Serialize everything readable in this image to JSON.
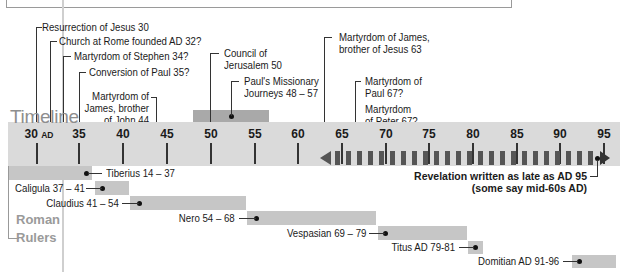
{
  "title": "Timeline",
  "scale": {
    "start_year": 30,
    "end_year": 95,
    "start_x": 37,
    "px_per_year": 8.72
  },
  "ticks": [
    {
      "year": 30,
      "label": "30",
      "suffix": "AD",
      "x": 37
    },
    {
      "year": 35,
      "label": "35",
      "x": 79
    },
    {
      "year": 40,
      "label": "40",
      "x": 123
    },
    {
      "year": 45,
      "label": "45",
      "x": 167
    },
    {
      "year": 50,
      "label": "50",
      "x": 211
    },
    {
      "year": 55,
      "label": "55",
      "x": 255
    },
    {
      "year": 60,
      "label": "60",
      "x": 298
    },
    {
      "year": 65,
      "label": "65",
      "x": 342
    },
    {
      "year": 70,
      "label": "70",
      "x": 386
    },
    {
      "year": 75,
      "label": "75",
      "x": 429
    },
    {
      "year": 80,
      "label": "80",
      "x": 473
    },
    {
      "year": 85,
      "label": "85",
      "x": 517
    },
    {
      "year": 90,
      "label": "90",
      "x": 560
    },
    {
      "year": 95,
      "label": "95",
      "x": 604
    }
  ],
  "events": [
    {
      "id": "resurrection",
      "label": "Resurrection of Jesus 30"
    },
    {
      "id": "church-rome",
      "label": "Church at Rome founded AD 32?"
    },
    {
      "id": "stephen",
      "label": "Martyrdom of Stephen 34?"
    },
    {
      "id": "paul-conversion",
      "label": "Conversion of Paul 35?"
    },
    {
      "id": "james-john",
      "lines": [
        "Martyrdom of",
        "James, brother",
        "of John 44"
      ]
    },
    {
      "id": "council",
      "lines": [
        "Council of",
        "Jerusalem 50"
      ]
    },
    {
      "id": "journeys",
      "lines": [
        "Paul's Missionary",
        "Journeys 48 – 57"
      ]
    },
    {
      "id": "james-jesus",
      "lines": [
        "Martyrdom of James,",
        "brother of Jesus 63"
      ]
    },
    {
      "id": "paul-martyr",
      "lines": [
        "Martyrdom of",
        "Paul 67?"
      ]
    },
    {
      "id": "peter-martyr",
      "lines": [
        "Martyrdom",
        "of Peter 67?"
      ]
    }
  ],
  "revelation": {
    "lines": [
      "Revelation written as late as AD 95",
      "(some say mid-60s AD)"
    ]
  },
  "roman_rulers": {
    "heading": [
      "Roman",
      "Rulers"
    ],
    "rulers": [
      {
        "name": "Tiberius 14 – 37",
        "start": 14,
        "end": 37
      },
      {
        "name": "Caligula 37 – 41",
        "start": 37,
        "end": 41
      },
      {
        "name": "Claudius 41 – 54",
        "start": 41,
        "end": 54
      },
      {
        "name": "Nero 54 – 68",
        "start": 54,
        "end": 68
      },
      {
        "name": "Vespasian 69 – 79",
        "start": 69,
        "end": 79
      },
      {
        "name": "Titus AD 79-81",
        "start": 79,
        "end": 81
      },
      {
        "name": "Domitian AD 91-96",
        "start": 91,
        "end": 96
      }
    ]
  },
  "colors": {
    "band": "#dadada",
    "bar": "#c6c6c6",
    "title": "#8e8e8e",
    "dash": "#555555"
  }
}
